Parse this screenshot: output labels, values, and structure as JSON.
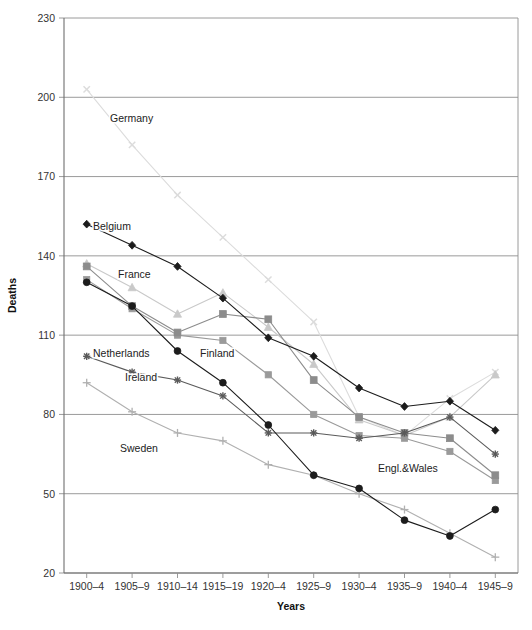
{
  "chart_data": {
    "type": "line",
    "title": "",
    "xlabel": "Years",
    "ylabel": "Deaths",
    "categories": [
      "1900–4",
      "1905–9",
      "1910–14",
      "1915–19",
      "1920–4",
      "1925–9",
      "1930–4",
      "1935–9",
      "1940–4",
      "1945–9"
    ],
    "ylim": [
      20,
      230
    ],
    "yticks": [
      20,
      50,
      80,
      110,
      140,
      170,
      200,
      230
    ],
    "ytick_labels": [
      "20",
      "50",
      "80",
      "110",
      "140",
      "170",
      "200",
      "230"
    ],
    "grid": "horizontal",
    "legend_position": "inline-annotations",
    "series": [
      {
        "name": "Germany",
        "label": "Germany",
        "color": "#dcdcdc",
        "marker": "x",
        "values": [
          203,
          182,
          163,
          147,
          131,
          115,
          79,
          72,
          86,
          96
        ]
      },
      {
        "name": "Belgium",
        "label": "Belgium",
        "color": "#1c1c1c",
        "marker": "diamond",
        "values": [
          152,
          144,
          136,
          124,
          109,
          102,
          90,
          83,
          85,
          74
        ]
      },
      {
        "name": "France",
        "label": "France",
        "color": "#c9c9c9",
        "marker": "triangle",
        "values": [
          137,
          128,
          118,
          126,
          113,
          99,
          78,
          72,
          79,
          95
        ]
      },
      {
        "name": "Finland",
        "label": "Finland",
        "color": "#8c8c8c",
        "marker": "square",
        "values": [
          136,
          121,
          111,
          118,
          116,
          93,
          79,
          73,
          71,
          57
        ]
      },
      {
        "name": "Netherlands",
        "label": "Netherlands",
        "color": "#1c1c1c",
        "marker": "circle",
        "values": [
          130,
          121,
          104,
          92,
          76,
          57,
          52,
          40,
          34,
          44
        ]
      },
      {
        "name": "Ireland",
        "label": "Ireland",
        "color": "#5a5a5a",
        "marker": "star",
        "values": [
          102,
          96,
          93,
          87,
          73,
          73,
          71,
          73,
          79,
          65
        ]
      },
      {
        "name": "Sweden",
        "label": "Sweden",
        "color": "#b0b0b0",
        "marker": "plus",
        "values": [
          92,
          81,
          73,
          70,
          61,
          57,
          50,
          44,
          35,
          26
        ]
      },
      {
        "name": "Engl.&Wales",
        "label": "Engl.&Wales",
        "color": "#9a9a9a",
        "marker": "square-small",
        "values": [
          131,
          120,
          110,
          108,
          95,
          80,
          72,
          71,
          66,
          55
        ]
      }
    ],
    "annotations": [
      {
        "text": "Germany",
        "x": 110,
        "y": 122
      },
      {
        "text": "Belgium",
        "x": 93,
        "y": 230
      },
      {
        "text": "France",
        "x": 118,
        "y": 278
      },
      {
        "text": "Netherlands",
        "x": 93,
        "y": 357
      },
      {
        "text": "Finland",
        "x": 200,
        "y": 357
      },
      {
        "text": "Ireland",
        "x": 125,
        "y": 381
      },
      {
        "text": "Sweden",
        "x": 120,
        "y": 452
      },
      {
        "text": "Engl.&Wales",
        "x": 378,
        "y": 472
      }
    ]
  },
  "plot": {
    "left": 64,
    "right": 518,
    "top": 18,
    "bottom": 573
  }
}
